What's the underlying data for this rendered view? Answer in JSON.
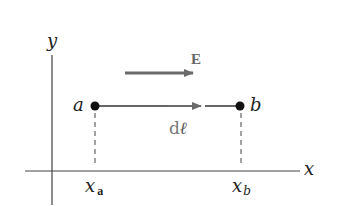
{
  "diagram": {
    "axes": {
      "x_label": "x",
      "y_label": "y"
    },
    "points": [
      {
        "label": "a",
        "x_label_main": "x",
        "x_label_sub": "a"
      },
      {
        "label": "b",
        "x_label_main": "x",
        "x_label_sub": "b"
      }
    ],
    "vectors": {
      "field_label": "E",
      "displacement_label_d": "d",
      "displacement_label_l": "ℓ"
    },
    "colors": {
      "axis": "#333333",
      "vector_gray": "#6b6b6b",
      "point": "#111111",
      "text": "#222222"
    }
  }
}
